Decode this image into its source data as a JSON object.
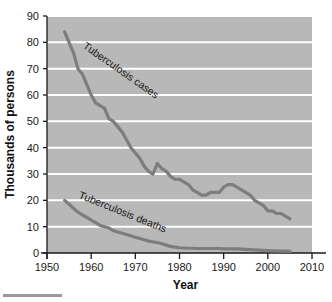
{
  "figure": {
    "plot_background": "#b8b8b8",
    "gridline_color": "#ffffff",
    "line_color": "#7d7d7d",
    "axis_color": "#1a1a1a",
    "footer_bar_color": "#9a9a9a"
  },
  "chart_data": {
    "type": "line",
    "title": "",
    "xlabel": "Year",
    "ylabel": "Thousands of persons",
    "xlim": [
      1950,
      2010
    ],
    "ylim": [
      0,
      90
    ],
    "xticks": [
      "1950",
      "1960",
      "1970",
      "1980",
      "1990",
      "2000",
      "2010"
    ],
    "yticks": [
      "0",
      "10",
      "20",
      "30",
      "40",
      "50",
      "60",
      "70",
      "80",
      "90"
    ],
    "grid": "horizontal",
    "legend": "inline-labels",
    "series": [
      {
        "name": "Tuberculosis cases",
        "label": "Tuberculosis cases",
        "x": [
          1954,
          1955,
          1956,
          1957,
          1958,
          1959,
          1960,
          1961,
          1962,
          1963,
          1964,
          1965,
          1966,
          1967,
          1968,
          1969,
          1970,
          1971,
          1972,
          1973,
          1974,
          1975,
          1976,
          1977,
          1978,
          1979,
          1980,
          1981,
          1982,
          1983,
          1984,
          1985,
          1986,
          1987,
          1988,
          1989,
          1990,
          1991,
          1992,
          1993,
          1994,
          1995,
          1996,
          1997,
          1998,
          1999,
          2000,
          2001,
          2002,
          2003,
          2004,
          2005
        ],
        "values": [
          84,
          80,
          76,
          70,
          68,
          64,
          60,
          57,
          56,
          55,
          51,
          50,
          48,
          46,
          43,
          40,
          38,
          36,
          33,
          31,
          30,
          34,
          32,
          31,
          29,
          28,
          28,
          27,
          26,
          24,
          23,
          22,
          22,
          23,
          23,
          23,
          25,
          26,
          26,
          25,
          24,
          23,
          22,
          20,
          19,
          18,
          16,
          16,
          15,
          15,
          14,
          13
        ],
        "label_angle": 35,
        "label_x": 1958,
        "label_y": 78
      },
      {
        "name": "Tuberculosis deaths",
        "label": "Tuberculosis deaths",
        "x": [
          1954,
          1955,
          1956,
          1957,
          1958,
          1959,
          1960,
          1961,
          1962,
          1963,
          1964,
          1965,
          1966,
          1967,
          1968,
          1969,
          1970,
          1971,
          1972,
          1973,
          1974,
          1975,
          1976,
          1977,
          1978,
          1979,
          1980,
          1981,
          1982,
          1983,
          1984,
          1985,
          1986,
          1987,
          1988,
          1989,
          1990,
          1991,
          1992,
          1993,
          1994,
          1995,
          1996,
          1997,
          1998,
          1999,
          2000,
          2001,
          2002,
          2003,
          2004,
          2005
        ],
        "values": [
          20,
          18.5,
          17,
          15.5,
          14.5,
          13.5,
          12.5,
          11.5,
          10.5,
          10,
          9.5,
          8.5,
          8,
          7.5,
          7,
          6.5,
          6,
          5.5,
          5,
          4.5,
          4.2,
          4,
          3.5,
          3,
          2.5,
          2.2,
          2,
          1.9,
          1.8,
          1.8,
          1.7,
          1.7,
          1.7,
          1.7,
          1.7,
          1.7,
          1.6,
          1.6,
          1.6,
          1.6,
          1.5,
          1.4,
          1.3,
          1.2,
          1.1,
          1.0,
          0.9,
          0.8,
          0.8,
          0.7,
          0.7,
          0.6
        ],
        "label_angle": 22,
        "label_x": 1957,
        "label_y": 21
      }
    ]
  }
}
